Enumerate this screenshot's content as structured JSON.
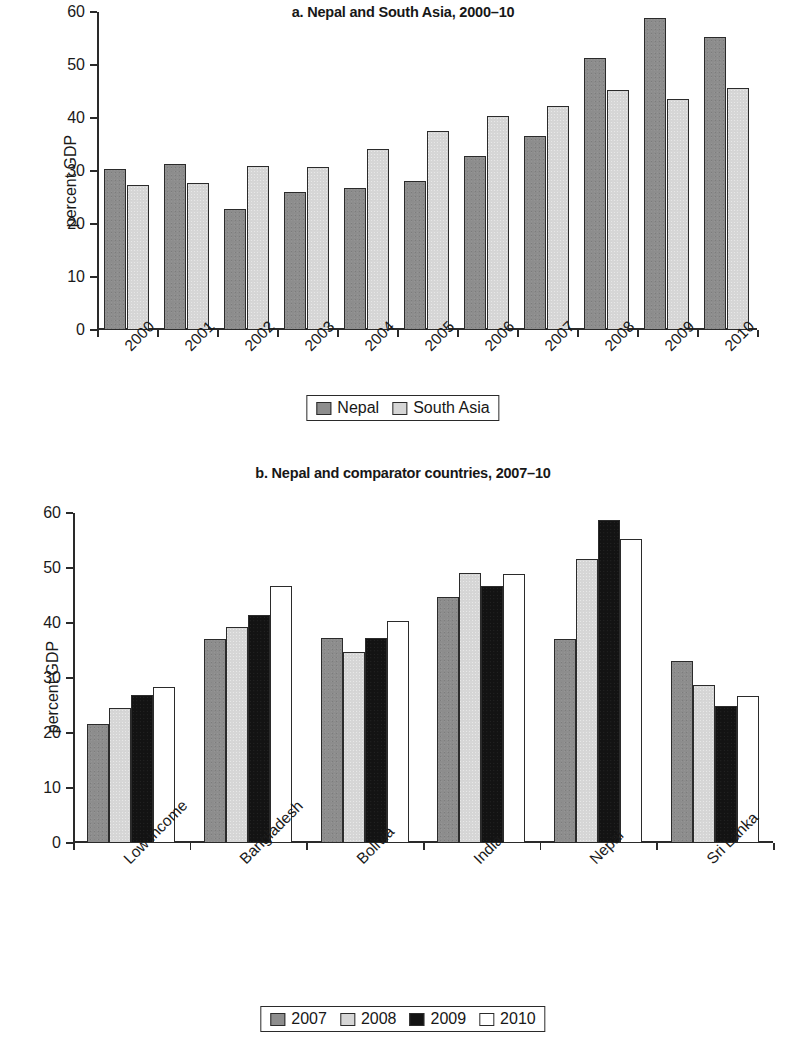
{
  "figure": {
    "y_axis_label": "percent GDP"
  },
  "panel_a": {
    "title": "a. Nepal and South Asia, 2000–10",
    "legend": [
      {
        "label": "Nepal",
        "swatch": "dark-gray-swatch"
      },
      {
        "label": "South Asia",
        "swatch": "light-gray-swatch"
      }
    ]
  },
  "panel_b": {
    "title": "b. Nepal and comparator countries, 2007–10",
    "legend": [
      {
        "label": "2007",
        "swatch": "dark-gray-swatch"
      },
      {
        "label": "2008",
        "swatch": "light-gray-swatch"
      },
      {
        "label": "2009",
        "swatch": "black-swatch"
      },
      {
        "label": "2010",
        "swatch": "white-swatch"
      }
    ]
  },
  "chart_data": [
    {
      "type": "bar",
      "title": "a. Nepal and South Asia, 2000–10",
      "xlabel": "",
      "ylabel": "percent GDP",
      "ylim": [
        0,
        60
      ],
      "yticks": [
        0,
        10,
        20,
        30,
        40,
        50,
        60
      ],
      "ytick_labels": [
        "0",
        "10",
        "20",
        "30",
        "40",
        "50",
        "60"
      ],
      "grid": false,
      "legend_position": "bottom",
      "categories": [
        "2000",
        "2001",
        "2002",
        "2003",
        "2004",
        "2005",
        "2006",
        "2007",
        "2008",
        "2009",
        "2010"
      ],
      "series": [
        {
          "name": "Nepal",
          "color": "#8d8d8d",
          "values": [
            30.3,
            31.4,
            22.8,
            26.1,
            26.8,
            28.2,
            32.8,
            36.7,
            51.4,
            58.8,
            55.3
          ]
        },
        {
          "name": "South Asia",
          "color": "#d6d6d6",
          "values": [
            27.4,
            27.8,
            31.0,
            30.8,
            34.2,
            37.5,
            40.4,
            42.2,
            45.2,
            43.6,
            45.6
          ]
        }
      ]
    },
    {
      "type": "bar",
      "title": "b. Nepal and comparator countries, 2007–10",
      "xlabel": "",
      "ylabel": "percent GDP",
      "ylim": [
        0,
        60
      ],
      "yticks": [
        0,
        10,
        20,
        30,
        40,
        50,
        60
      ],
      "ytick_labels": [
        "0",
        "10",
        "20",
        "30",
        "40",
        "50",
        "60"
      ],
      "grid": false,
      "legend_position": "bottom",
      "categories": [
        "Low income",
        "Bangladesh",
        "Bolivia",
        "India",
        "Nepal",
        "Sri Lanka"
      ],
      "series": [
        {
          "name": "2007",
          "color": "#8d8d8d",
          "values": [
            21.7,
            37.1,
            37.2,
            44.7,
            37.1,
            33.1
          ]
        },
        {
          "name": "2008",
          "color": "#d6d6d6",
          "values": [
            24.5,
            39.3,
            34.8,
            49.1,
            51.6,
            28.8
          ]
        },
        {
          "name": "2009",
          "color": "#131313",
          "values": [
            27.0,
            41.5,
            37.2,
            46.8,
            58.8,
            25.0
          ]
        },
        {
          "name": "2010",
          "color": "#ffffff",
          "values": [
            28.4,
            46.8,
            40.3,
            48.9,
            55.2,
            26.8
          ]
        }
      ]
    }
  ]
}
